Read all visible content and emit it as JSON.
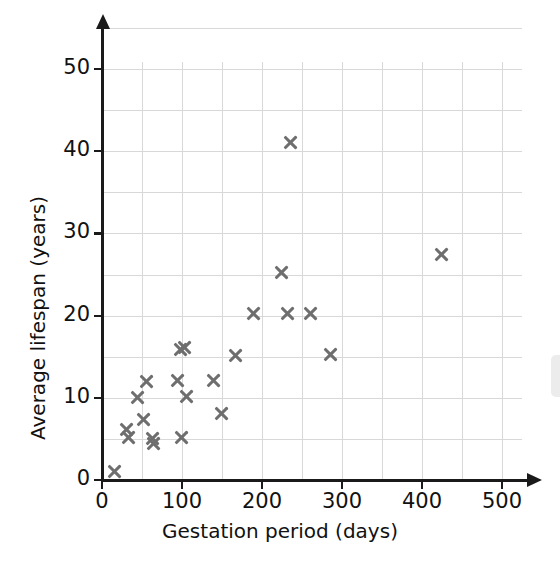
{
  "chart_data": {
    "type": "scatter",
    "title": "",
    "xlabel": "Gestation period (days)",
    "ylabel": "Average lifespan (years)",
    "xlim": [
      0,
      500
    ],
    "ylim": [
      0,
      55
    ],
    "xticks": [
      0,
      100,
      200,
      300,
      400,
      500
    ],
    "yticks": [
      0,
      10,
      20,
      30,
      40,
      50
    ],
    "x_minor_step": 50,
    "y_minor_step": 5,
    "grid": true,
    "legend": null,
    "marker": "x",
    "marker_color": "#6e6e6e",
    "points": [
      {
        "x": 16,
        "y": 1.0
      },
      {
        "x": 31,
        "y": 6.2
      },
      {
        "x": 33,
        "y": 5.2
      },
      {
        "x": 44,
        "y": 10.0
      },
      {
        "x": 52,
        "y": 7.3
      },
      {
        "x": 56,
        "y": 12.0
      },
      {
        "x": 63,
        "y": 5.1
      },
      {
        "x": 65,
        "y": 4.5
      },
      {
        "x": 95,
        "y": 12.1
      },
      {
        "x": 98,
        "y": 15.9
      },
      {
        "x": 103,
        "y": 16.1
      },
      {
        "x": 100,
        "y": 5.2
      },
      {
        "x": 106,
        "y": 10.2
      },
      {
        "x": 140,
        "y": 12.1
      },
      {
        "x": 150,
        "y": 8.1
      },
      {
        "x": 167,
        "y": 15.2
      },
      {
        "x": 190,
        "y": 20.3
      },
      {
        "x": 225,
        "y": 25.3
      },
      {
        "x": 232,
        "y": 20.3
      },
      {
        "x": 236,
        "y": 41.1
      },
      {
        "x": 261,
        "y": 20.3
      },
      {
        "x": 286,
        "y": 15.3
      },
      {
        "x": 425,
        "y": 27.4
      }
    ]
  }
}
